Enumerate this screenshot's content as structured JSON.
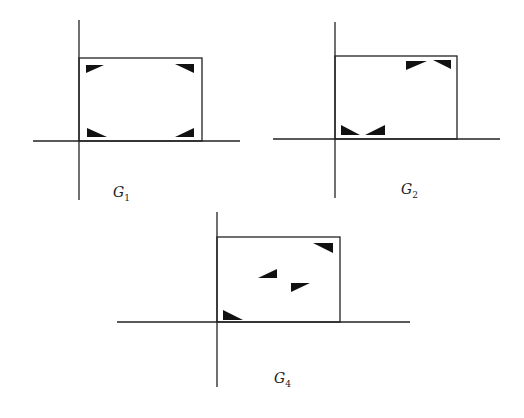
{
  "figure": {
    "panels": [
      {
        "id": "G1",
        "label": "G",
        "subscript": "1",
        "vaxis": {
          "x": 79,
          "y1": 20,
          "y2": 200
        },
        "haxis": {
          "y": 141,
          "x1": 33,
          "x2": 240
        },
        "box": {
          "x": 79,
          "y": 58,
          "w": 123,
          "h": 83
        },
        "triangles": [
          [
            [
              86,
              65
            ],
            [
              104,
              65
            ],
            [
              86,
              73
            ]
          ],
          [
            [
              175,
              64
            ],
            [
              194,
              64
            ],
            [
              194,
              73
            ]
          ],
          [
            [
              87,
              128
            ],
            [
              87,
              137
            ],
            [
              107,
              137
            ]
          ],
          [
            [
              194,
              128
            ],
            [
              194,
              137
            ],
            [
              175,
              137
            ]
          ]
        ],
        "label_pos": {
          "x": 113,
          "y": 186
        }
      },
      {
        "id": "G2",
        "label": "G",
        "subscript": "2",
        "vaxis": {
          "x": 335,
          "y1": 22,
          "y2": 198
        },
        "haxis": {
          "y": 139,
          "x1": 273,
          "x2": 500
        },
        "box": {
          "x": 335,
          "y": 56,
          "w": 122,
          "h": 83
        },
        "triangles": [
          [
            [
              406,
              61
            ],
            [
              427,
              61
            ],
            [
              406,
              70
            ]
          ],
          [
            [
              433,
              60
            ],
            [
              451,
              60
            ],
            [
              451,
              69
            ]
          ],
          [
            [
              341,
              125
            ],
            [
              341,
              135
            ],
            [
              360,
              135
            ]
          ],
          [
            [
              385,
              125
            ],
            [
              385,
              135
            ],
            [
              365,
              135
            ]
          ]
        ],
        "label_pos": {
          "x": 400,
          "y": 183
        }
      },
      {
        "id": "G4",
        "label": "G",
        "subscript": "4",
        "vaxis": {
          "x": 217,
          "y1": 212,
          "y2": 387
        },
        "haxis": {
          "y": 322,
          "x1": 117,
          "x2": 410
        },
        "box": {
          "x": 217,
          "y": 237,
          "w": 123,
          "h": 85
        },
        "triangles": [
          [
            [
              313,
              243
            ],
            [
              333,
              243
            ],
            [
              333,
              253
            ]
          ],
          [
            [
              277,
              269
            ],
            [
              277,
              278
            ],
            [
              258,
              278
            ]
          ],
          [
            [
              291,
              283
            ],
            [
              310,
              283
            ],
            [
              291,
              292
            ]
          ],
          [
            [
              223,
              310
            ],
            [
              223,
              320
            ],
            [
              243,
              320
            ]
          ]
        ],
        "label_pos": {
          "x": 274,
          "y": 372
        }
      }
    ]
  },
  "labels": {
    "g1": {
      "main": "G",
      "sub": "1"
    },
    "g2": {
      "main": "G",
      "sub": "2"
    },
    "g4": {
      "main": "G",
      "sub": "4"
    }
  }
}
